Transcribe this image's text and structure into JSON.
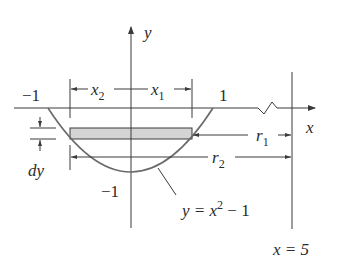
{
  "diagram": {
    "type": "washer-method-region",
    "axes": {
      "x_label": "x",
      "y_label": "y"
    },
    "tick_labels": {
      "x_neg_one": "−1",
      "x_pos_one": "1",
      "y_neg_one": "−1"
    },
    "dimension_labels": {
      "x2": "x",
      "x2_sub": "2",
      "x1": "x",
      "x1_sub": "1",
      "r1": "r",
      "r1_sub": "1",
      "r2": "r",
      "r2_sub": "2",
      "dy": "dy"
    },
    "curve_label": {
      "lhs": "y = x",
      "exp": "2",
      "rhs": " − 1"
    },
    "line_label": "x = 5",
    "colors": {
      "ink": "#3a3a3a",
      "curve": "#6a6a6a",
      "strip_fill": "#d4d4d4"
    }
  }
}
